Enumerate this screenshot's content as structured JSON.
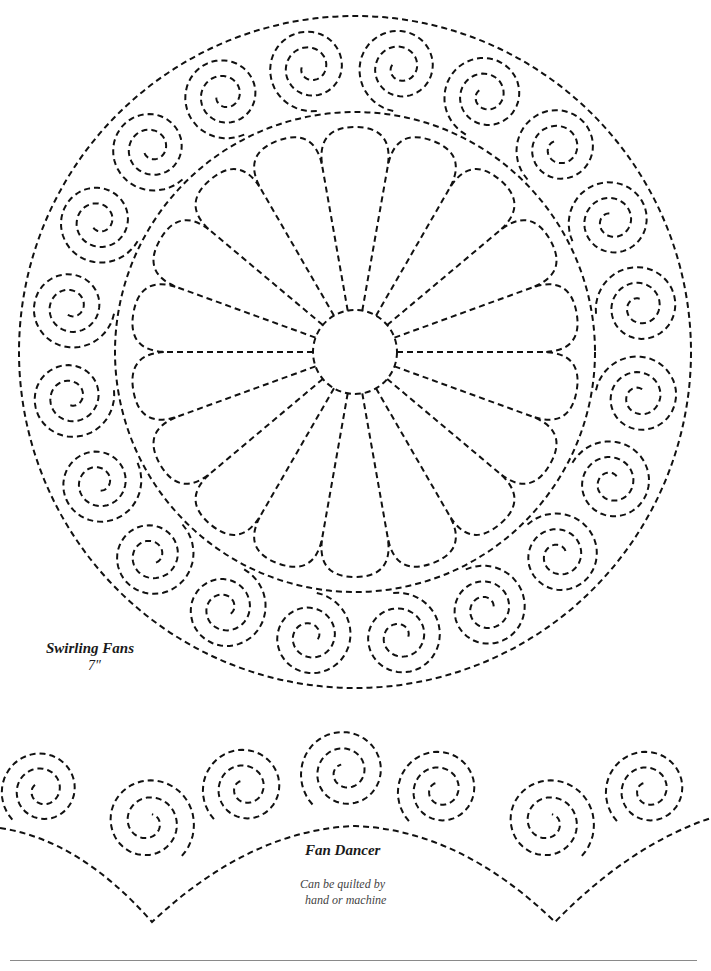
{
  "colors": {
    "stitch": "#111111",
    "background": "#ffffff",
    "rule": "#8a8a8a",
    "note": "#444444"
  },
  "swirling_fans": {
    "title": "Swirling Fans",
    "size": "7″",
    "center": [
      355,
      352
    ],
    "outer_radius": 336,
    "inner_ring_radius": 240,
    "hub_radius": 42,
    "petal_count": 18,
    "petal_tip_radius": 225,
    "ring_swirl_count": 20,
    "ring_swirl_radius": 288
  },
  "fan_dancer": {
    "title": "Fan Dancer",
    "note_line1": "Can be quilted by",
    "note_line2": "hand or machine",
    "swirls": [
      {
        "x": 42,
        "y": 790,
        "r": 42,
        "dir": 1
      },
      {
        "x": 148,
        "y": 822,
        "r": 48,
        "dir": -1
      },
      {
        "x": 245,
        "y": 788,
        "r": 44,
        "dir": 1
      },
      {
        "x": 345,
        "y": 772,
        "r": 46,
        "dir": 1
      },
      {
        "x": 440,
        "y": 790,
        "r": 44,
        "dir": 1
      },
      {
        "x": 548,
        "y": 822,
        "r": 48,
        "dir": -1
      },
      {
        "x": 648,
        "y": 790,
        "r": 44,
        "dir": 1
      }
    ],
    "points": [
      [
        152,
        922
      ],
      [
        555,
        922
      ]
    ]
  }
}
